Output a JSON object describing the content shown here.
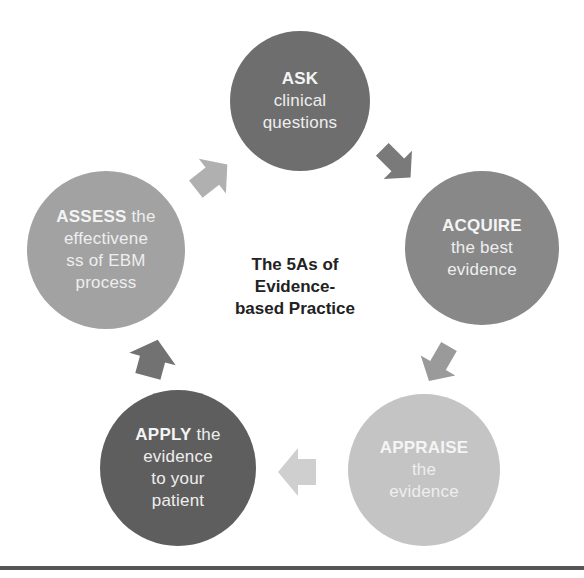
{
  "diagram": {
    "title": {
      "lines": [
        "The 5As of",
        "Evidence-",
        "based Practice"
      ]
    },
    "nodes": [
      {
        "id": "ask",
        "keyword": "ASK",
        "rest_first": "",
        "lines": [
          "clinical",
          "questions"
        ],
        "color": "#6e6e6e",
        "cx": 300,
        "cy": 101,
        "r": 70
      },
      {
        "id": "acquire",
        "keyword": "ACQUIRE",
        "rest_first": "",
        "lines": [
          "the best",
          "evidence"
        ],
        "color": "#888888",
        "cx": 482,
        "cy": 248,
        "r": 77
      },
      {
        "id": "appraise",
        "keyword": "APPRAISE",
        "rest_first": "",
        "lines": [
          "the",
          "evidence"
        ],
        "color": "#c4c4c4",
        "cx": 424,
        "cy": 470,
        "r": 76
      },
      {
        "id": "apply",
        "keyword": "APPLY",
        "rest_first": " the",
        "lines": [
          "evidence",
          "to your",
          "patient"
        ],
        "color": "#5e5e5e",
        "cx": 178,
        "cy": 468,
        "r": 78
      },
      {
        "id": "assess",
        "keyword": "ASSESS",
        "rest_first": " the",
        "lines": [
          "effectivene",
          "ss of EBM",
          "process"
        ],
        "color": "#a2a2a2",
        "cx": 106,
        "cy": 250,
        "r": 79
      }
    ],
    "arrows": [
      {
        "id": "ask-to-acquire",
        "direction": "down-right",
        "color": "#7a7a7a"
      },
      {
        "id": "acquire-to-appraise",
        "direction": "down-left",
        "color": "#9a9a9a"
      },
      {
        "id": "appraise-to-apply",
        "direction": "left",
        "color": "#cfcfcf"
      },
      {
        "id": "apply-to-assess",
        "direction": "up",
        "color": "#727272"
      },
      {
        "id": "assess-to-ask",
        "direction": "up-right",
        "color": "#b0b0b0"
      }
    ]
  }
}
